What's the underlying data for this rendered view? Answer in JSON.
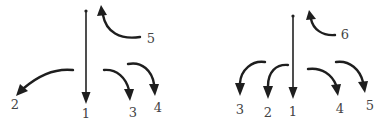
{
  "diagrams": [
    {
      "name": "left",
      "labels": [
        {
          "text": "1",
          "x": 86,
          "y": 118
        },
        {
          "text": "2",
          "x": 15,
          "y": 109
        },
        {
          "text": "3",
          "x": 133,
          "y": 117
        },
        {
          "text": "4",
          "x": 158,
          "y": 112
        },
        {
          "text": "5",
          "x": 151,
          "y": 43
        }
      ]
    },
    {
      "name": "right",
      "labels": [
        {
          "text": "1",
          "x": 293,
          "y": 116
        },
        {
          "text": "2",
          "x": 268,
          "y": 117
        },
        {
          "text": "3",
          "x": 240,
          "y": 114
        },
        {
          "text": "4",
          "x": 340,
          "y": 113
        },
        {
          "text": "5",
          "x": 370,
          "y": 110
        },
        {
          "text": "6",
          "x": 345,
          "y": 39
        }
      ]
    }
  ],
  "colors": {
    "stroke": "#1e1e1e",
    "label": "#444444",
    "background": "#ffffff"
  }
}
